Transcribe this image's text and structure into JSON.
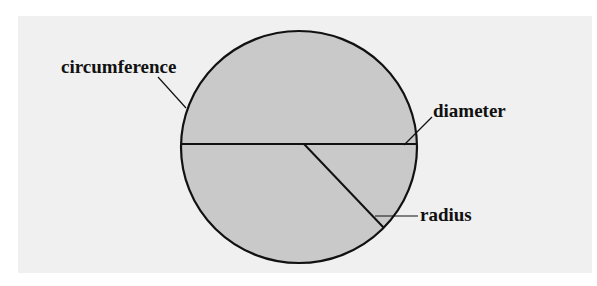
{
  "diagram": {
    "labels": {
      "circumference": "circumference",
      "diameter": "diameter",
      "radius": "radius"
    },
    "colors": {
      "background": "#ffffff",
      "panel": "#f0f0f0",
      "circle_fill": "#c9c9c9",
      "stroke": "#111111"
    }
  }
}
